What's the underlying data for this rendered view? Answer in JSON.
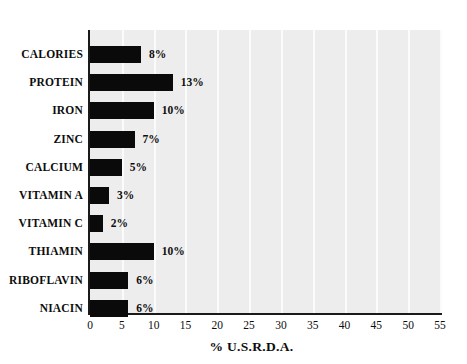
{
  "chart_data": {
    "type": "bar",
    "orientation": "horizontal",
    "title": "",
    "xlabel": "% U.S.R.D.A.",
    "ylabel": "",
    "xlim": [
      0,
      55
    ],
    "xticks": [
      0,
      5,
      10,
      15,
      20,
      25,
      30,
      35,
      40,
      45,
      50,
      55
    ],
    "xtick_labels": [
      "0",
      "5",
      "10",
      "15",
      "20",
      "25",
      "30",
      "35",
      "40",
      "45",
      "50",
      "55"
    ],
    "grid": "vertical-white",
    "legend": "none",
    "categories": [
      "CALORIES",
      "PROTEIN",
      "IRON",
      "ZINC",
      "CALCIUM",
      "VITAMIN A",
      "VITAMIN C",
      "THIAMIN",
      "RIBOFLAVIN",
      "NIACIN"
    ],
    "values": [
      8,
      13,
      10,
      7,
      5,
      3,
      2,
      10,
      6,
      6
    ],
    "data_labels": [
      "8%",
      "13%",
      "10%",
      "7%",
      "5%",
      "3%",
      "2%",
      "10%",
      "6%",
      "6%"
    ],
    "bar_color": "#0a0a0a",
    "plot_background": "#ededed",
    "gridline_color": "#fbfbfb",
    "axis_color": "#1a1a1a"
  }
}
